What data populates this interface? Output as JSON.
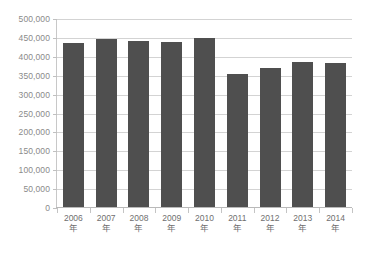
{
  "chart_data": {
    "type": "bar",
    "title": "",
    "subtitle": "",
    "xlabel": "",
    "ylabel": "",
    "categories": [
      "2006年",
      "2007年",
      "2008年",
      "2009年",
      "2010年",
      "2011年",
      "2012年",
      "2013年",
      "2014年"
    ],
    "values": [
      434000,
      445000,
      439000,
      437000,
      448000,
      353000,
      368000,
      383000,
      381000
    ],
    "ylim": [
      0,
      500000
    ],
    "ytick_step": 50000,
    "ytick_labels": [
      "500,000",
      "450,000",
      "400,000",
      "350,000",
      "300,000",
      "250,000",
      "200,000",
      "150,000",
      "100,000",
      "50,000",
      "0"
    ],
    "ytick_values": [
      500000,
      450000,
      400000,
      350000,
      300000,
      250000,
      200000,
      150000,
      100000,
      50000,
      0
    ],
    "grid": true,
    "grid_axis": "y",
    "legend": false,
    "legend_position": "none",
    "series": [
      {
        "name": "",
        "values": [
          434000,
          445000,
          439000,
          437000,
          448000,
          353000,
          368000,
          383000,
          381000
        ]
      }
    ]
  },
  "style": {
    "bar_color": "#4f4f4f",
    "grid_color": "#d3d3d3",
    "axis_color": "#b9b9b9",
    "ylabel_color": "#8a8a8a",
    "xlabel_color": "#6f6f6f",
    "background": "#ffffff"
  }
}
